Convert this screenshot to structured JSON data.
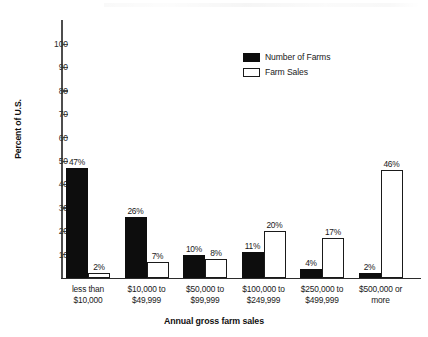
{
  "chart_data": {
    "type": "bar",
    "title": "",
    "xlabel": "Annual gross farm sales",
    "ylabel": "Percent of U.S.",
    "ylim": [
      0,
      105
    ],
    "ytick_labels": [
      "100",
      "90",
      "80",
      "70",
      "60",
      "50",
      "40",
      "30",
      "20",
      "10"
    ],
    "ytick_values": [
      100,
      90,
      80,
      70,
      60,
      50,
      40,
      30,
      20,
      10
    ],
    "grid": false,
    "legend_position": "upper-center",
    "categories": [
      "less than $10,000",
      "$10,000 to $49,999",
      "$50,000 to $99,999",
      "$100,000 to $249,999",
      "$250,000 to $499,999",
      "$500,000 or more"
    ],
    "category_lines": [
      [
        "less than",
        "$10,000"
      ],
      [
        "$10,000 to",
        "$49,999"
      ],
      [
        "$50,000 to",
        "$99,999"
      ],
      [
        "$100,000 to",
        "$249,999"
      ],
      [
        "$250,000 to",
        "$499,999"
      ],
      [
        "$500,000 or",
        "more"
      ]
    ],
    "series": [
      {
        "name": "Number of Farms",
        "color": "#0d0d0d",
        "style": "filled",
        "values": [
          47,
          26,
          10,
          11,
          4,
          2
        ],
        "data_labels": [
          "47%",
          "26%",
          "10%",
          "11%",
          "4%",
          "2%"
        ]
      },
      {
        "name": "Farm Sales",
        "color": "#ffffff",
        "style": "outlined",
        "values": [
          2,
          7,
          8,
          20,
          17,
          46
        ],
        "data_labels": [
          "2%",
          "7%",
          "8%",
          "20%",
          "17%",
          "46%"
        ]
      }
    ]
  },
  "legend": {
    "items": [
      {
        "label": "Number of Farms",
        "swatch": "filled-black"
      },
      {
        "label": "Farm Sales",
        "swatch": "outlined-white"
      }
    ]
  },
  "axes": {
    "y_title": "Percent of U.S.",
    "x_title": "Annual gross farm sales"
  },
  "colors": {
    "series_dark": "#0d0d0d",
    "series_light": "#ffffff",
    "axis": "#2b2b2b",
    "text": "#1a1a1a",
    "background": "#ffffff"
  }
}
